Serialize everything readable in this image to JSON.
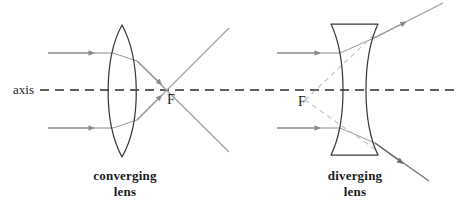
{
  "figure": {
    "axis_label": "axis",
    "colors": {
      "lens_outline": "#3a3a3a",
      "ray": "#8a8a8a",
      "virtual_ray": "#b0b0b0",
      "axis": "#2b2b2b",
      "text": "#1b1b1b",
      "background": "#ffffff"
    }
  },
  "panels": [
    {
      "id": "converging",
      "caption_line1": "converging",
      "caption_line2": "lens",
      "focus_label": "F",
      "lens_type": "biconvex",
      "lens": {
        "center_x": 122,
        "top_y": 25,
        "bottom_y": 157,
        "left_x": 103,
        "right_x": 142
      },
      "focal_point": {
        "x": 172,
        "y": 90
      },
      "incident_rays": [
        {
          "y": 53,
          "x_start": 48,
          "x_end": 112
        },
        {
          "y": 128,
          "x_start": 48,
          "x_end": 112
        }
      ],
      "refracted_rays": [
        {
          "from_x": 133,
          "from_y": 53,
          "to_x": 229,
          "to_y": 152
        },
        {
          "from_x": 133,
          "from_y": 128,
          "to_x": 229,
          "to_y": 28
        }
      ]
    },
    {
      "id": "diverging",
      "caption_line1": "diverging",
      "caption_line2": "lens",
      "focus_label": "F",
      "lens_type": "biconcave",
      "lens": {
        "center_x": 354,
        "top_y": 24,
        "bottom_y": 155,
        "left_x": 331,
        "right_x": 378
      },
      "focal_point": {
        "x": 305,
        "y": 100
      },
      "incident_rays": [
        {
          "y": 53,
          "x_start": 277,
          "x_end": 338
        },
        {
          "y": 128,
          "x_start": 277,
          "x_end": 338
        }
      ],
      "refracted_rays": [
        {
          "from_x": 372,
          "from_y": 40,
          "to_x": 442,
          "to_y": 4
        },
        {
          "from_x": 372,
          "from_y": 141,
          "to_x": 429,
          "to_y": 180
        }
      ],
      "virtual_rays": [
        {
          "from_x": 305,
          "from_y": 100,
          "to_x": 375,
          "to_y": 34
        },
        {
          "from_x": 305,
          "from_y": 100,
          "to_x": 378,
          "to_y": 152
        }
      ]
    }
  ],
  "axis": {
    "y": 90,
    "x_start": 40,
    "x_end": 456,
    "style": "dashed"
  }
}
